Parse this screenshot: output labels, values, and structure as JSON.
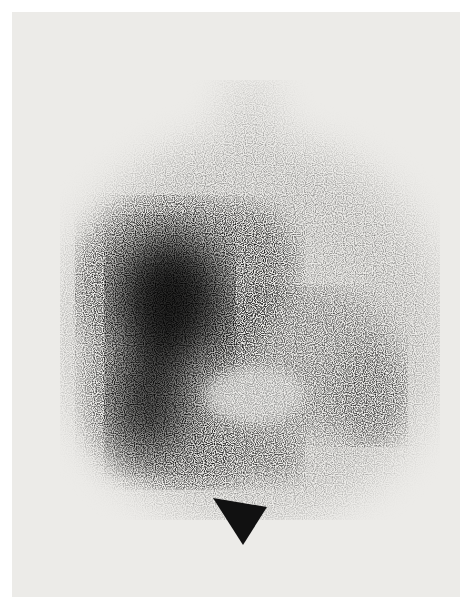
{
  "image": {
    "kind": "nuclear medicine scintigraphy scan (grayscale)",
    "background_color": "#ecebe8",
    "uptake_color": "#111111",
    "regions": [
      {
        "name": "main-dense-uptake",
        "description": "large dense dark mass on left/center"
      },
      {
        "name": "upper-lobe",
        "description": "rounded dense region upper center-right of main mass"
      },
      {
        "name": "right-faint-uptake",
        "description": "moderate speckled region on right"
      },
      {
        "name": "scatter-streak",
        "description": "sparse dots extending upward from mass"
      }
    ],
    "annotations": [
      {
        "type": "arrowhead",
        "color": "#111111",
        "points": [
          [
            213,
            498
          ],
          [
            267,
            507
          ],
          [
            243,
            545
          ]
        ],
        "pointing": "up-left toward lower mass"
      }
    ]
  }
}
